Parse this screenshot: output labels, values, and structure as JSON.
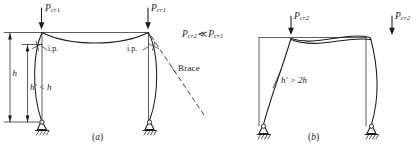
{
  "figure": {
    "ink_color": "#1c1c1c",
    "background": "#ffffff"
  },
  "panel_a": {
    "caption": "(a)",
    "caption_letter": "a",
    "description": "Braced frame, symmetric non-sway buckling mode",
    "loads": [
      {
        "name": "P",
        "subscript": "cr1",
        "position": "left-column-top"
      },
      {
        "name": "P",
        "subscript": "cr1",
        "position": "right-column-top"
      }
    ],
    "inflection_points": [
      {
        "label": "i.p.",
        "position": "left-column-upper"
      },
      {
        "label": "i.p.",
        "position": "right-column-upper"
      }
    ],
    "dimensions": [
      {
        "label": "h",
        "meaning": "full story height"
      },
      {
        "label": "h'",
        "relation": "<",
        "compare": "h",
        "text": "h' < h"
      }
    ],
    "brace": {
      "label": "Brace",
      "style": "dashed"
    },
    "relation": {
      "left": "P",
      "left_sub": "cr2",
      "operator": "≪",
      "right": "P",
      "right_sub": "cr1",
      "text": "Pcr2 ≪ Pcr1"
    },
    "supports": [
      {
        "type": "pin-support",
        "position": "left"
      },
      {
        "type": "pin-support",
        "position": "right"
      }
    ]
  },
  "panel_b": {
    "caption": "(b)",
    "caption_letter": "b",
    "description": "Unbraced frame, sway buckling mode",
    "loads": [
      {
        "name": "P",
        "subscript": "cr2",
        "position": "left-column-top"
      },
      {
        "name": "P",
        "subscript": "cr2",
        "position": "right-column-top"
      }
    ],
    "dimensions": [
      {
        "label": "h'",
        "relation": ">",
        "compare": "2h",
        "text": "h' > 2h"
      }
    ],
    "supports": [
      {
        "type": "pin-support",
        "position": "left"
      },
      {
        "type": "pin-support",
        "position": "right"
      }
    ]
  },
  "icons": {
    "load_arrow": "down-arrow-icon",
    "dimension_arrow": "double-arrow-icon",
    "pin_support": "pin-support-icon",
    "ground_hatch": "ground-hatch-icon",
    "leader": "leader-line-icon"
  }
}
